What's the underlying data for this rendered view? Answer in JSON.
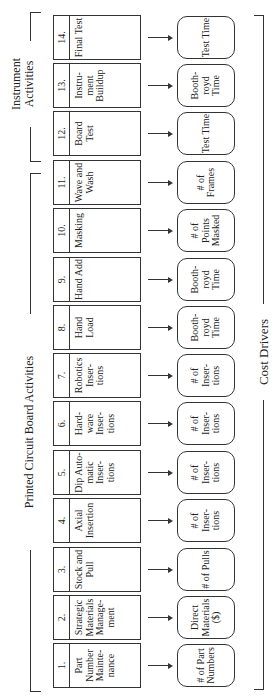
{
  "groups": {
    "pcb": "Printed Circuit Board Activities",
    "instrument": "Instrument Activities",
    "cost_drivers": "Cost Drivers"
  },
  "activities": [
    {
      "num": "1.",
      "label": "Part Number Mainte- nance",
      "driver": "# of Part Numbers"
    },
    {
      "num": "2.",
      "label": "Strategic Materials Manage- ment",
      "driver": "Direct Materials ($)"
    },
    {
      "num": "3.",
      "label": "Stock and Pull",
      "driver": "# of Pulls"
    },
    {
      "num": "4.",
      "label": "Axial Insertion",
      "driver": "# of Inser- tions"
    },
    {
      "num": "5.",
      "label": "Dip Auto- matic Inser- tions",
      "driver": "# of Inser- tions"
    },
    {
      "num": "6.",
      "label": "Hard- ware Inser- tions",
      "driver": "# of Inser- tions"
    },
    {
      "num": "7.",
      "label": "Robotics Inser- tions",
      "driver": "# of Inser- tions"
    },
    {
      "num": "8.",
      "label": "Hand Load",
      "driver": "Booth- royd Time"
    },
    {
      "num": "9.",
      "label": "Hand Add",
      "driver": "Booth- royd Time"
    },
    {
      "num": "10.",
      "label": "Masking",
      "driver": "# of Points Masked"
    },
    {
      "num": "11.",
      "label": "Wave and Wash",
      "driver": "# of Frames"
    },
    {
      "num": "12.",
      "label": "Board Test",
      "driver": "Test Time"
    },
    {
      "num": "13.",
      "label": "Instru- ment Buildup",
      "driver": "Booth- royd Time"
    },
    {
      "num": "14.",
      "label": "Final Test",
      "driver": "Test Time"
    }
  ]
}
